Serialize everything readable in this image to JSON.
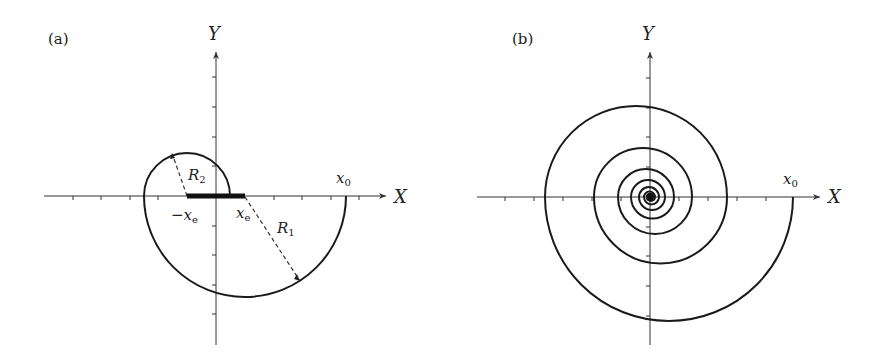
{
  "figure": {
    "panels": [
      {
        "id": "a",
        "label": "(a)",
        "x_axis_label": "X",
        "y_axis_label": "Y",
        "annotations": {
          "x0": "x",
          "x0_sub": "0",
          "neg_xe": "−x",
          "neg_xe_sub": "e",
          "xe": "x",
          "xe_sub": "e",
          "R1": "R",
          "R1_sub": "1",
          "R2": "R",
          "R2_sub": "2"
        }
      },
      {
        "id": "b",
        "label": "(b)",
        "x_axis_label": "X",
        "y_axis_label": "Y",
        "annotations": {
          "x0": "x",
          "x0_sub": "0"
        }
      }
    ]
  },
  "colors": {
    "ink": "#1a1a1a",
    "background": "#ffffff"
  }
}
